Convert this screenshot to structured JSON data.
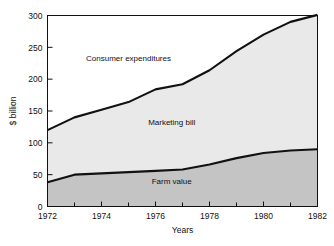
{
  "chart_data": {
    "type": "area",
    "stacked": true,
    "title": "",
    "xlabel": "Years",
    "ylabel": "$ billion",
    "x": [
      1972,
      1973,
      1974,
      1975,
      1976,
      1977,
      1978,
      1979,
      1980,
      1981,
      1982
    ],
    "xlim": [
      1972,
      1982
    ],
    "ylim": [
      0,
      300
    ],
    "xticks": [
      1972,
      1974,
      1976,
      1978,
      1980,
      1982
    ],
    "xtick_labels": [
      "1972",
      "1974",
      "1976",
      "1978",
      "1980",
      "1982"
    ],
    "xminorticks": [
      1973,
      1975,
      1977,
      1979,
      1981
    ],
    "yticks": [
      0,
      50,
      100,
      150,
      200,
      250,
      300
    ],
    "ytick_labels": [
      "0",
      "50",
      "100",
      "150",
      "200",
      "250",
      "300"
    ],
    "grid": false,
    "legend": "inline-labels",
    "series": [
      {
        "name": "Farm value",
        "label": "Farm value",
        "color": "#c4c4c4",
        "line_color": "#111111",
        "values": [
          38,
          50,
          52,
          54,
          56,
          58,
          66,
          76,
          84,
          88,
          90
        ]
      },
      {
        "name": "Marketing bill",
        "label": "Marketing bill",
        "color": "#e9e9e9",
        "line_color": "#111111",
        "values": [
          82,
          90,
          100,
          110,
          128,
          134,
          148,
          168,
          186,
          202,
          211
        ]
      }
    ],
    "cumulative_top": {
      "name": "Consumer expenditures",
      "label": "Consumer expenditures",
      "values": [
        120,
        140,
        152,
        164,
        184,
        192,
        214,
        244,
        270,
        290,
        301
      ]
    },
    "annotations": [
      {
        "text": "Consumer expenditures",
        "x": 1975.0,
        "y": 228
      },
      {
        "text": "Marketing bill",
        "x": 1976.6,
        "y": 128
      },
      {
        "text": "Farm value",
        "x": 1976.6,
        "y": 35
      }
    ],
    "frame_color": "#111111",
    "background": "#ffffff"
  }
}
